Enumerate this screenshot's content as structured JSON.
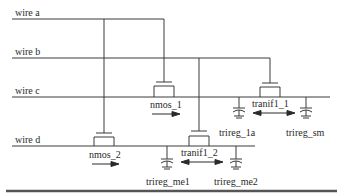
{
  "diagram": {
    "wires": [
      {
        "label": "wire a"
      },
      {
        "label": "wire b"
      },
      {
        "label": "wire c"
      },
      {
        "label": "wire d"
      }
    ],
    "transistors": [
      {
        "label": "nmos_1",
        "direction": "unidirectional"
      },
      {
        "label": "nmos_2",
        "direction": "unidirectional"
      },
      {
        "label": "tranif1_1",
        "direction": "bidirectional"
      },
      {
        "label": "tranif1_2",
        "direction": "bidirectional"
      }
    ],
    "capacitors": [
      {
        "label": "trireg_1a"
      },
      {
        "label": "trireg_sm"
      },
      {
        "label": "trireg_me1"
      },
      {
        "label": "trireg_me2"
      }
    ],
    "colors": {
      "line": "#3a3a3a",
      "text": "#2a2a2a",
      "background": "#ffffff"
    }
  }
}
